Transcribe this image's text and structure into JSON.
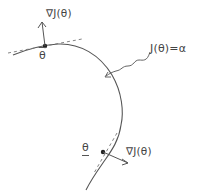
{
  "diagram": {
    "type": "level-set-gradient-sketch",
    "curve_label": "J(θ)=α",
    "upper_point": {
      "label": "θ",
      "decoration": "overbar",
      "gradient_label": "∇J(θ)",
      "gradient_direction": "up",
      "tangent": "dashed"
    },
    "lower_point": {
      "label": "θ",
      "decoration": "underbar",
      "gradient_label": "∇J(θ)",
      "gradient_direction": "down-right",
      "tangent": "dashed"
    },
    "pointer": "wavy-arrow-to-curve"
  },
  "colors": {
    "stroke": "#555555",
    "text": "#444444",
    "background": "#ffffff"
  }
}
